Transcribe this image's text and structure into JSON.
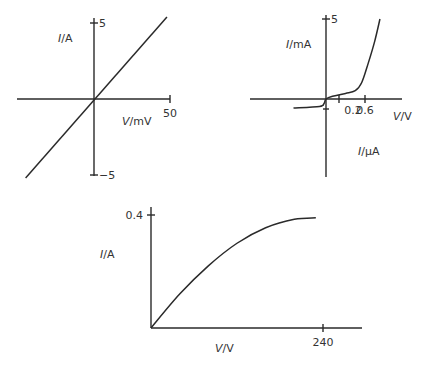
{
  "chart_data": [
    {
      "type": "line",
      "title": "",
      "xlabel_var": "V",
      "xlabel_unit": "/mV",
      "ylabel_var": "I",
      "ylabel_unit": "/A",
      "xlim": [
        -50,
        50
      ],
      "ylim": [
        -5,
        5
      ],
      "x_ticks": [
        {
          "value": 50,
          "label": "50"
        }
      ],
      "y_ticks": [
        {
          "value": 5,
          "label": "5"
        },
        {
          "value": -5,
          "label": "−5"
        }
      ],
      "series": [
        {
          "name": "ohmic",
          "x": [
            -45,
            48
          ],
          "y": [
            -5.2,
            5.4
          ]
        }
      ],
      "grid": false
    },
    {
      "type": "line",
      "title": "",
      "xlabel_var": "V",
      "xlabel_unit": "/V",
      "ylabel_var": "I",
      "ylabel_unit": "/mA",
      "ylabel_neg_var": "I",
      "ylabel_neg_unit": "/µA",
      "xlim": [
        -0.55,
        0.9
      ],
      "ylim": [
        -5,
        5
      ],
      "x_ticks": [
        {
          "value": 0.2,
          "label": "0.2"
        },
        {
          "value": 0.6,
          "label": "0.6"
        }
      ],
      "y_ticks": [
        {
          "value": 5,
          "label": "5"
        }
      ],
      "series": [
        {
          "name": "diode",
          "x": [
            -0.5,
            -0.1,
            -0.03,
            0,
            0.1,
            0.3,
            0.45,
            0.55,
            0.65,
            0.75,
            0.83
          ],
          "y": [
            -0.3,
            -0.25,
            -0.15,
            0,
            0.2,
            0.4,
            0.6,
            1.2,
            2.6,
            4.2,
            5.8
          ]
        }
      ],
      "grid": false
    },
    {
      "type": "line",
      "title": "",
      "xlabel_var": "V",
      "xlabel_unit": "/V",
      "ylabel_var": "I",
      "ylabel_unit": "/A",
      "xlim": [
        0,
        285
      ],
      "ylim": [
        0,
        0.45
      ],
      "x_ticks": [
        {
          "value": 240,
          "label": "240"
        }
      ],
      "y_ticks": [
        {
          "value": 0.4,
          "label": "0.4"
        }
      ],
      "series": [
        {
          "name": "filament lamp",
          "x": [
            0,
            40,
            80,
            120,
            160,
            200,
            230
          ],
          "y": [
            0,
            0.12,
            0.22,
            0.3,
            0.355,
            0.385,
            0.39
          ]
        }
      ],
      "grid": false
    }
  ]
}
